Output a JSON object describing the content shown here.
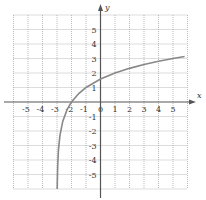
{
  "chart_data": {
    "type": "line",
    "title": "",
    "function": "y = log2(x + 3)",
    "xlabel": "x",
    "ylabel": "y",
    "xlim": [
      -6,
      6
    ],
    "ylim": [
      -6,
      6
    ],
    "grid": true,
    "grid_style": "dotted",
    "x_ticks": [
      "-5",
      "-4",
      "-3",
      "-2",
      "-1",
      "0",
      "1",
      "2",
      "3",
      "4",
      "5"
    ],
    "y_ticks": [
      "5",
      "4",
      "3",
      "2",
      "1",
      "-1",
      "-2",
      "-3",
      "-4",
      "-5"
    ],
    "asymptote_x": -3,
    "series": [
      {
        "name": "curve",
        "x": [
          -2.98,
          -2.95,
          -2.9,
          -2.8,
          -2.6,
          -2.3,
          -2,
          -1.5,
          -1,
          0,
          1,
          2,
          3,
          4,
          5,
          5.8
        ],
        "y": [
          -5.64,
          -4.32,
          -3.32,
          -2.32,
          -1.32,
          -0.51,
          0,
          0.58,
          1,
          1.58,
          2,
          2.32,
          2.58,
          2.81,
          3,
          3.14
        ]
      }
    ]
  },
  "labels": {
    "x_axis": "x",
    "y_axis": "y",
    "origin": "0"
  }
}
